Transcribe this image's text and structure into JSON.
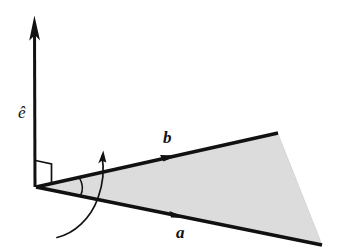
{
  "figure": {
    "background_color": "#ffffff",
    "ink_color": "#111111",
    "shade_color": "#dcdcdc",
    "shade_edge_color": "#d0d0d0"
  },
  "labels": {
    "unit_normal": "ê",
    "unit_normal_name": "e-hat",
    "vector_a": "a",
    "vector_b": "b"
  },
  "geometry": {
    "origin": {
      "x": 36,
      "y": 187
    },
    "axis_tip": {
      "x": 34,
      "y": 16
    },
    "vector_a_tip": {
      "x": 322,
      "y": 245
    },
    "vector_b_tip": {
      "x": 278,
      "y": 133
    },
    "vector_a_arrowhead": {
      "x": 182,
      "y": 215
    },
    "vector_b_arrowhead": {
      "x": 174,
      "y": 158
    },
    "rotation_arc_start": {
      "x": 57,
      "y": 237
    },
    "rotation_arc_tip": {
      "x": 103,
      "y": 151
    },
    "right_angle_marker": {
      "x": 36,
      "y": 187
    },
    "angle_arc_radius": 44
  },
  "elements": [
    {
      "name": "unit-normal-axis",
      "kind": "arrow",
      "label": "ê"
    },
    {
      "name": "vector-a",
      "kind": "arrow",
      "label": "a"
    },
    {
      "name": "vector-b",
      "kind": "arrow",
      "label": "b"
    },
    {
      "name": "shaded-wedge",
      "kind": "polygon",
      "label": ""
    },
    {
      "name": "right-angle-marker",
      "kind": "marker",
      "label": ""
    },
    {
      "name": "rotation-arc-arrow",
      "kind": "arc",
      "label": ""
    },
    {
      "name": "angle-arc",
      "kind": "arc",
      "label": ""
    }
  ]
}
